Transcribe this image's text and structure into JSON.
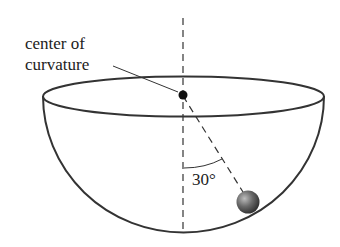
{
  "diagram": {
    "label_line1": "center of",
    "label_line2": "curvature",
    "angle_label": "30°",
    "angle_degrees": 30,
    "colors": {
      "stroke": "#333333",
      "ball": "#555555",
      "background": "#ffffff"
    }
  }
}
